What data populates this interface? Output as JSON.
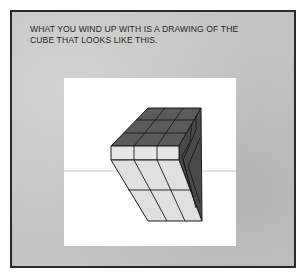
{
  "panel": {
    "caption_line1": "WHAT YOU WIND UP WITH IS A DRAWING OF THE",
    "caption_line2": "CUBE THAT LOOKS LIKE THIS."
  },
  "illustration": {
    "subject": "3x3 cube drawn in perspective",
    "colors": {
      "top_face": "#5a5a5a",
      "side_face": "#4a4a4a",
      "front_face": "#e4e4e4",
      "horizon_line": "#bdbdbd",
      "panel_bg": "#c4c4c4"
    }
  }
}
